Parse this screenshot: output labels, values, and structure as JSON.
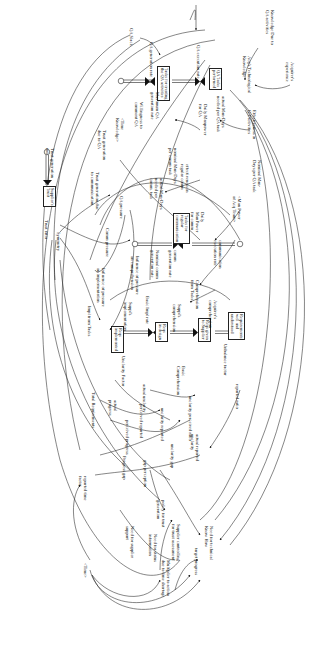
{
  "diagram": {
    "type": "system-dynamics-stock-flow",
    "orientation": "rotated-90-clockwise",
    "stocks": [
      {
        "id": "tasks_qa_done",
        "label": "QA Tasks\nperformed",
        "x": 219,
        "y": 68
      },
      {
        "id": "tasks_qa_create",
        "label": "Tasks for creating\nthe QA activities",
        "x": 165,
        "y": 68
      },
      {
        "id": "tasks_regular_comm",
        "label": "Tasks for\nregular\ncommunication",
        "x": 180,
        "y": 215
      },
      {
        "id": "suppliers_trust",
        "label": "Supplier's\nTrust",
        "x": 53,
        "y": 190
      },
      {
        "id": "req_understood",
        "label": "Requirements\nwell and\nunderstood",
        "x": 238,
        "y": 317
      },
      {
        "id": "reqs_given_supplier",
        "label": "Reqs given\nto Supplier",
        "x": 199,
        "y": 320
      },
      {
        "id": "reqs_in_design",
        "label": "Reqs\nin design",
        "x": 158,
        "y": 325
      },
      {
        "id": "reqs_implemented",
        "label": "Reqs\nimplemented",
        "x": 113,
        "y": 332
      }
    ],
    "variables": [
      {
        "id": "knowledge_due_qa",
        "label": "Knowledge Due to\nQA activities",
        "x": 270,
        "y": 30
      },
      {
        "id": "acquirers_experience",
        "label": "Acquirer's\nexperience",
        "x": 290,
        "y": 70
      },
      {
        "id": "acq_tech_knowledge",
        "label": "Acq's Technological\nKnowledge",
        "x": 250,
        "y": 70
      },
      {
        "id": "qa_execution_rate",
        "label": "QA execution rate",
        "x": 200,
        "y": 37
      },
      {
        "id": "qa_generation_rate",
        "label": "QA generation rate",
        "x": 153,
        "y": 45
      },
      {
        "id": "qa_slack",
        "label": "QA Slack",
        "x": 133,
        "y": 33
      },
      {
        "id": "maximum_qa_gen_rate",
        "label": "Maximum QA\ngeneration rate",
        "x": 159,
        "y": 108
      },
      {
        "id": "willingness_comment_qa",
        "label": "Willingness to\ncomment QA",
        "x": 142,
        "y": 116
      },
      {
        "id": "time_knowledge",
        "label": "<Time\nKnowledge>",
        "x": 124,
        "y": 130
      },
      {
        "id": "trust_gen_due_qa",
        "label": "Trust generation\ndue to QA",
        "x": 105,
        "y": 141
      },
      {
        "id": "actual_mandays_qa",
        "label": "actual Man-Days\nneeded per QA task",
        "x": 224,
        "y": 115
      },
      {
        "id": "daily_manpower_qa",
        "label": "Daily Manpower\nfor QA",
        "x": 205,
        "y": 118
      },
      {
        "id": "effectiveness_qa",
        "label": "Effectiveness in\nQA activities",
        "x": 255,
        "y": 118
      },
      {
        "id": "nominal_mandays_qa",
        "label": "Nominal Man-\nDays per QA task",
        "x": 258,
        "y": 165
      },
      {
        "id": "man_power_acq_team",
        "label": "<Man Power\nof Acq Team>",
        "x": 240,
        "y": 200
      },
      {
        "id": "effectiveness_regular_comm",
        "label": "effectiveness in\nregular comm",
        "x": 188,
        "y": 172
      },
      {
        "id": "nominal_mandays_comm",
        "label": "nominal Man-Days\nper comm task",
        "x": 175,
        "y": 152
      },
      {
        "id": "actual_mandays_comm",
        "label": "actual Man-Days\nneeded per\ncomm. task",
        "x": 160,
        "y": 188
      },
      {
        "id": "daily_manpower_comm",
        "label": "Daily\nManPower\nfor comm",
        "x": 200,
        "y": 208
      },
      {
        "id": "comm_execution_rate",
        "label": "communication\nexecution rate",
        "x": 220,
        "y": 245
      },
      {
        "id": "comm_generation_rate",
        "label": "comm\ngeneration rate",
        "x": 176,
        "y": 240
      },
      {
        "id": "nominal_comm_gen_rate",
        "label": "Nominal comm\ngeneration rate",
        "x": 158,
        "y": 248
      },
      {
        "id": "trust_gen_due_comm",
        "label": "Trust generation due\nto communication",
        "x": 98,
        "y": 178
      },
      {
        "id": "trust_generation_rate",
        "label": "Trust generation\nrate",
        "x": 52,
        "y": 160
      },
      {
        "id": "trust_ratio",
        "label": "Trust ratio",
        "x": 48,
        "y": 225
      },
      {
        "id": "symmetry",
        "label": "Symmetry",
        "x": 60,
        "y": 232
      },
      {
        "id": "qa_pressure",
        "label": "QA pressure",
        "x": 122,
        "y": 210
      },
      {
        "id": "comm_pressure",
        "label": "Comm pressure",
        "x": 108,
        "y": 238
      },
      {
        "id": "influence_pressure_comp",
        "label": "Influence of pressure\non comprehension",
        "x": 138,
        "y": 258
      },
      {
        "id": "influence_pressure_impl",
        "label": "Influence of pressure\non implementation",
        "x": 104,
        "y": 272
      },
      {
        "id": "impl_from_tasks",
        "label": "Impl from Tasks",
        "x": 90,
        "y": 316
      },
      {
        "id": "basic_impl_rate",
        "label": "Basic Impl rate",
        "x": 148,
        "y": 305
      },
      {
        "id": "suppls_implementation",
        "label": "Suppl's\nimplementation",
        "x": 130,
        "y": 310
      },
      {
        "id": "suppls_comprehension",
        "label": "Suppl's\ncomprehension",
        "x": 180,
        "y": 318
      },
      {
        "id": "comprehension_from_tasks",
        "label": "Comprehension\nfrom Tasks",
        "x": 196,
        "y": 285
      },
      {
        "id": "acquirers_comprehension",
        "label": "Acquirer's\ncomprehension",
        "x": 215,
        "y": 310
      },
      {
        "id": "unclarity_factor_top",
        "label": "Unclarity Factor",
        "x": 124,
        "y": 357
      },
      {
        "id": "basic_comprehension",
        "label": "Basic\nComprehension",
        "x": 182,
        "y": 370
      },
      {
        "id": "unbalance_factor",
        "label": "Unbalance factor",
        "x": 226,
        "y": 350
      },
      {
        "id": "reported_ratio",
        "label": "reported ratio",
        "x": 238,
        "y": 385
      },
      {
        "id": "actual_unclarity",
        "label": "actual unclarity",
        "x": 144,
        "y": 385
      },
      {
        "id": "total_requirements",
        "label": "Total Requirements",
        "x": 94,
        "y": 398
      },
      {
        "id": "actual_progress",
        "label": "actual\nprogress",
        "x": 115,
        "y": 405
      },
      {
        "id": "perceived_reported",
        "label": "perceived reported",
        "x": 142,
        "y": 412
      },
      {
        "id": "unclarity_reported",
        "label": "unclarity reported",
        "x": 163,
        "y": 410
      },
      {
        "id": "unclarity_perceived_ratio",
        "label": "unclarity perceived ratio",
        "x": 190,
        "y": 402
      },
      {
        "id": "unclarity_gap",
        "label": "unclarity gap",
        "x": 172,
        "y": 447
      },
      {
        "id": "actual_reported",
        "label": "actual reported\nunclarity",
        "x": 198,
        "y": 438
      },
      {
        "id": "perceived_progress",
        "label": "perceived progress",
        "x": 127,
        "y": 425
      },
      {
        "id": "progress_gap",
        "label": "Progress gap",
        "x": 125,
        "y": 460
      },
      {
        "id": "gap_perception",
        "label": "gap perception",
        "x": 145,
        "y": 462
      },
      {
        "id": "reported_time_factor",
        "label": "reported time\nfactor",
        "x": 85,
        "y": 480
      },
      {
        "id": "policy_trust_gen",
        "label": "policy for trust\ngeneration",
        "x": 163,
        "y": 508
      },
      {
        "id": "need_supplier_support",
        "label": "Need for supplier\nsupport",
        "x": 132,
        "y": 528
      },
      {
        "id": "need_status_info",
        "label": "Need for status\ninformation",
        "x": 156,
        "y": 540
      },
      {
        "id": "need_technical_knowhow",
        "label": "Need for technical\nKnow How",
        "x": 210,
        "y": 530
      },
      {
        "id": "supplier_controlling_trust",
        "label": "Supplier controlling\nfor trust assessment",
        "x": 178,
        "y": 530
      },
      {
        "id": "target_progress",
        "label": "target progress",
        "x": 196,
        "y": 552
      },
      {
        "id": "multiplier_action_time",
        "label": "Multiplier to action\ndue to time shortage",
        "x": 168,
        "y": 566
      },
      {
        "id": "time",
        "label": "<Time>",
        "x": 85,
        "y": 565
      }
    ]
  }
}
